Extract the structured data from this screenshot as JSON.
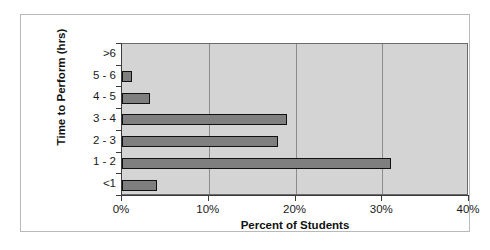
{
  "chart_data": {
    "type": "bar",
    "orientation": "horizontal",
    "title": "",
    "xlabel": "Percent of Students",
    "ylabel": "Time to Perform (hrs)",
    "categories": [
      ">6",
      "5 - 6",
      "4 - 5",
      "3 - 4",
      "2 - 3",
      "1 - 2",
      "<1"
    ],
    "values": [
      0,
      1.2,
      3.2,
      19.0,
      18.0,
      31.0,
      4.0
    ],
    "xlim": [
      0,
      40
    ],
    "xtick_labels": [
      "0%",
      "10%",
      "20%",
      "30%",
      "40%"
    ],
    "xtick_values": [
      0,
      10,
      20,
      30,
      40
    ],
    "grid": "vertical",
    "legend": "none",
    "bar_color": "#7f7f7f",
    "bar_edge_color": "#111111",
    "plot_background": "#d4d4d4",
    "gridline_color": "#8c8c8c",
    "axis_color": "#3a3a3a"
  }
}
